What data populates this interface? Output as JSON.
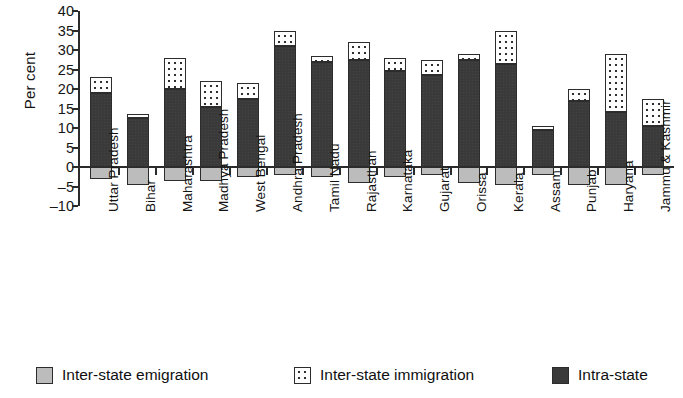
{
  "chart_data": {
    "type": "bar",
    "title": "",
    "xlabel": "",
    "ylabel": "Per cent",
    "ylim": [
      -10,
      40
    ],
    "yticks": [
      40,
      35,
      30,
      25,
      20,
      15,
      10,
      5,
      0,
      -5,
      -10
    ],
    "grid": false,
    "stacked": true,
    "legend_position": "bottom",
    "categories": [
      "Uttar Pradesh",
      "Bihar",
      "Maharashtra",
      "Madhya Pradesh",
      "West Bengal",
      "Andhra Pradesh",
      "Tamil Nadu",
      "Rajasthan",
      "Karnataka",
      "Gujarat",
      "Orissa",
      "Kerala",
      "Assam",
      "Punjab",
      "Haryana",
      "Jammu & Kashmir"
    ],
    "series": [
      {
        "name": "Intra-state",
        "color": "#3a3a3a",
        "values": [
          19.0,
          12.5,
          20.0,
          15.5,
          17.5,
          31.0,
          27.0,
          27.5,
          24.5,
          23.5,
          27.5,
          26.5,
          9.5,
          17.0,
          14.0,
          10.5
        ]
      },
      {
        "name": "Inter-state immigration",
        "color": "#fdfdfd",
        "values": [
          4.0,
          1.0,
          8.0,
          6.5,
          4.0,
          4.0,
          1.5,
          4.5,
          3.5,
          4.0,
          1.5,
          8.5,
          1.0,
          3.0,
          15.0,
          7.0
        ]
      },
      {
        "name": "Inter-state emigration",
        "color": "#bcbcbc",
        "values": [
          -3.0,
          -4.5,
          -3.5,
          -3.5,
          -2.5,
          -2.0,
          -2.5,
          -4.0,
          -2.5,
          -2.0,
          -4.0,
          -4.5,
          -2.0,
          -4.5,
          -4.5,
          -2.0
        ]
      }
    ],
    "totals": [
      23.0,
      13.5,
      28.0,
      22.0,
      21.5,
      35.0,
      28.5,
      32.0,
      28.0,
      27.5,
      29.0,
      35.0,
      10.5,
      20.0,
      29.0,
      17.5
    ]
  },
  "legend": {
    "items": [
      {
        "label": "Inter-state emigration",
        "swatch": "emigration-swatch"
      },
      {
        "label": "Inter-state immigration",
        "swatch": "immigration-swatch"
      },
      {
        "label": "Intra-state",
        "swatch": "intrastate-swatch"
      }
    ]
  }
}
